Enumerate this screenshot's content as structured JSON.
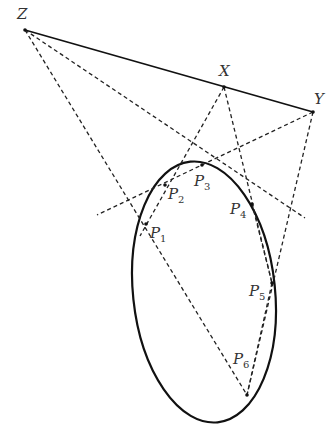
{
  "diagram": {
    "points": {
      "Z": {
        "label": "Z",
        "x": 25,
        "y": 30
      },
      "X": {
        "label": "X",
        "x": 224,
        "y": 87
      },
      "Y": {
        "label": "Y",
        "x": 313,
        "y": 112
      },
      "P1": {
        "label": "P",
        "sub": "1",
        "x": 146,
        "y": 224
      },
      "P2": {
        "label": "P",
        "sub": "2",
        "x": 165,
        "y": 185
      },
      "P3": {
        "label": "P",
        "sub": "3",
        "x": 202,
        "y": 165
      },
      "P4": {
        "label": "P",
        "sub": "4",
        "x": 252,
        "y": 204
      },
      "P5": {
        "label": "P",
        "sub": "5",
        "x": 272,
        "y": 283
      },
      "P6": {
        "label": "P",
        "sub": "6",
        "x": 247,
        "y": 395
      }
    },
    "colors": {
      "stroke": "#111111",
      "label": "#333333",
      "background": "#ffffff"
    }
  }
}
